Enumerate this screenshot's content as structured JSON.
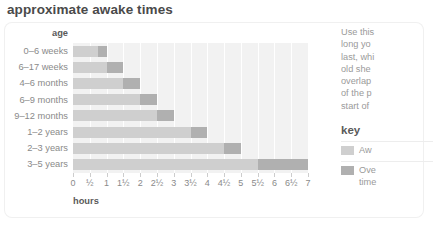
{
  "title": "approximate awake times",
  "chart": {
    "y_axis_header": "age",
    "x_axis_label": "hours"
  },
  "side": {
    "paragraph_lines": [
      "Use this",
      "long yo",
      "last, whi",
      "old she",
      "overlap",
      "of the p",
      "start of"
    ],
    "key_title": "key",
    "key_items": [
      {
        "label": "Aw",
        "color": "#cfcfcf"
      },
      {
        "label": "Ove",
        "label2": "time",
        "color": "#b0b0b0"
      }
    ]
  },
  "colors": {
    "awake": "#cfcfcf",
    "overtired": "#b0b0b0",
    "plot_background": "#f2f2f2",
    "gridline": "#ffffff",
    "text_muted": "#8a8a8a",
    "text_dark": "#4a4a4a"
  },
  "chart_data": {
    "type": "bar",
    "orientation": "horizontal",
    "title": "approximate awake times",
    "xlabel": "hours",
    "ylabel": "age",
    "xlim": [
      0,
      7
    ],
    "grid": true,
    "legend_position": "right",
    "categories": [
      "0–6 weeks",
      "6–17 weeks",
      "4–6 months",
      "6–9 months",
      "9–12 months",
      "1–2 years",
      "2–3 years",
      "3–5 years"
    ],
    "xticks": [
      0,
      0.5,
      1,
      1.5,
      2,
      2.5,
      3,
      3.5,
      4,
      4.5,
      5,
      5.5,
      6,
      6.5,
      7
    ],
    "xticklabels": [
      "0",
      "½",
      "1",
      "1½",
      "2",
      "2½",
      "3",
      "3½",
      "4",
      "4½",
      "5",
      "5½",
      "6",
      "6½",
      "7"
    ],
    "series": [
      {
        "name": "Awake",
        "color": "#cfcfcf",
        "values": [
          0.75,
          1.0,
          1.5,
          2.0,
          2.5,
          3.5,
          4.5,
          5.5
        ]
      },
      {
        "name": "Overtired",
        "color": "#b0b0b0",
        "values": [
          0.25,
          0.5,
          0.5,
          0.5,
          0.5,
          0.5,
          0.5,
          1.5
        ]
      }
    ],
    "totals": [
      1.0,
      1.5,
      2.0,
      2.5,
      3.0,
      4.0,
      5.0,
      7.0
    ],
    "stacked": true
  }
}
